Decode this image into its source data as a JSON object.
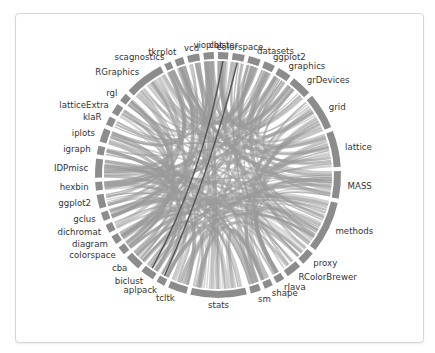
{
  "chart_data": {
    "type": "chord",
    "title": "",
    "center": [
      218,
      175
    ],
    "radius": 120,
    "arc_color": "#8c8c8c",
    "chord_color": "#9a9a9a",
    "highlight_chord_color": "#555555",
    "segments": [
      {
        "name": "vioplot",
        "size": 1.2
      },
      {
        "name": "cluster",
        "size": 1.2
      },
      {
        "name": "colorspace",
        "size": 1.4
      },
      {
        "name": "datasets",
        "size": 1.4
      },
      {
        "name": "ggplot2",
        "size": 1.3
      },
      {
        "name": "graphics",
        "size": 1.6
      },
      {
        "name": "grDevices",
        "size": 2.4
      },
      {
        "name": "grid",
        "size": 4.2
      },
      {
        "name": "lattice",
        "size": 4.2
      },
      {
        "name": "MASS",
        "size": 3.2
      },
      {
        "name": "methods",
        "size": 6.0
      },
      {
        "name": "proxy",
        "size": 1.6
      },
      {
        "name": "RColorBrewer",
        "size": 1.8
      },
      {
        "name": "rJava",
        "size": 1.0
      },
      {
        "name": "shape",
        "size": 1.0
      },
      {
        "name": "sm",
        "size": 1.2
      },
      {
        "name": "stats",
        "size": 6.5
      },
      {
        "name": "tcltk",
        "size": 2.2
      },
      {
        "name": "aplpack",
        "size": 1.0
      },
      {
        "name": "biclust",
        "size": 1.6
      },
      {
        "name": "cba",
        "size": 1.8
      },
      {
        "name": "colorspace",
        "size": 1.0
      },
      {
        "name": "diagram",
        "size": 1.0
      },
      {
        "name": "dichromat",
        "size": 1.0
      },
      {
        "name": "gclus",
        "size": 1.0
      },
      {
        "name": "ggplot2",
        "size": 1.6
      },
      {
        "name": "hexbin",
        "size": 1.0
      },
      {
        "name": "IDPmisc",
        "size": 2.2
      },
      {
        "name": "igraph",
        "size": 1.0
      },
      {
        "name": "iplots",
        "size": 1.6
      },
      {
        "name": "klaR",
        "size": 1.0
      },
      {
        "name": "latticeExtra",
        "size": 1.2
      },
      {
        "name": "rgl",
        "size": 1.0
      },
      {
        "name": "RGraphics",
        "size": 4.6
      },
      {
        "name": "scagnostics",
        "size": 0.8
      },
      {
        "name": "tkrplot",
        "size": 1.0
      },
      {
        "name": "vcd",
        "size": 1.4
      }
    ],
    "highlight_chords": [
      {
        "from": "cluster",
        "to": "biclust"
      },
      {
        "from": "colorspace",
        "to": "aplpack"
      }
    ],
    "legend": "none",
    "grid": false
  }
}
